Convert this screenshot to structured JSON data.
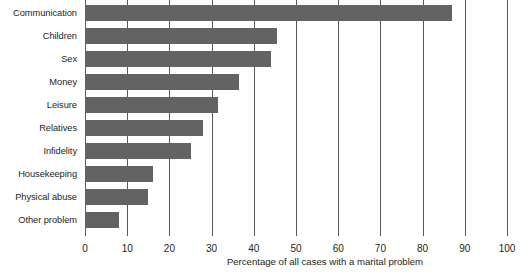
{
  "chart_data": {
    "type": "bar",
    "orientation": "horizontal",
    "title": "",
    "subtitle": "",
    "xlabel": "Percentage of all cases with a marital problem",
    "ylabel": "",
    "categories": [
      "Communication",
      "Children",
      "Sex",
      "Money",
      "Leisure",
      "Relatives",
      "Infidelity",
      "Housekeeping",
      "Physical abuse",
      "Other problem"
    ],
    "values": [
      87,
      45.5,
      44,
      36.5,
      31.5,
      28,
      25,
      16,
      15,
      8
    ],
    "xlim": [
      0,
      100
    ],
    "xticks": [
      0,
      10,
      20,
      30,
      40,
      50,
      60,
      70,
      80,
      90,
      100
    ],
    "xtick_labels": [
      "0",
      "10",
      "20",
      "30",
      "40",
      "50",
      "60",
      "70",
      "80",
      "90",
      "100"
    ],
    "grid": "vertical",
    "legend": "none",
    "bar_color": "#636363",
    "grid_color": "#58595b",
    "text_color": "#231f20",
    "background_color": "#ffffff"
  }
}
